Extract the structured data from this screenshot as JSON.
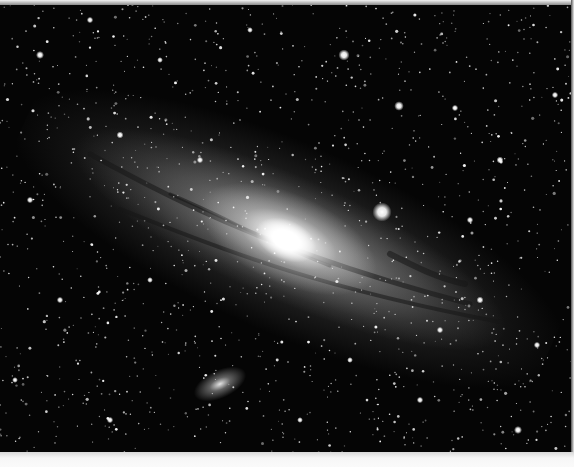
{
  "image": {
    "subject": "Andromeda Galaxy with companion galaxy",
    "colors": {
      "sky": "#050505",
      "core": "#ffffff",
      "border": "#fafafa"
    },
    "main_galaxy": {
      "cx": 288,
      "cy": 235,
      "angle_deg": 24
    },
    "companion_galaxy": {
      "cx": 220,
      "cy": 380,
      "angle_deg": -25
    },
    "satellite_core": {
      "cx": 382,
      "cy": 212,
      "r": 7
    }
  },
  "bright_stars": [
    [
      382,
      212,
      6
    ],
    [
      344,
      55,
      3.5
    ],
    [
      399,
      106,
      3
    ],
    [
      40,
      55,
      2.5
    ],
    [
      90,
      20,
      2
    ],
    [
      120,
      135,
      2.2
    ],
    [
      470,
      220,
      2
    ],
    [
      518,
      430,
      2.5
    ],
    [
      537,
      345,
      2
    ],
    [
      455,
      108,
      2
    ],
    [
      555,
      95,
      2
    ],
    [
      60,
      300,
      2
    ],
    [
      30,
      200,
      2
    ],
    [
      500,
      160,
      2.2
    ],
    [
      160,
      60,
      1.8
    ],
    [
      250,
      30,
      1.8
    ],
    [
      420,
      400,
      2
    ],
    [
      300,
      420,
      1.8
    ],
    [
      110,
      420,
      2
    ],
    [
      15,
      380,
      1.8
    ],
    [
      480,
      300,
      2.2
    ],
    [
      440,
      330,
      2
    ],
    [
      350,
      360,
      1.8
    ],
    [
      200,
      160,
      2
    ],
    [
      150,
      280,
      1.8
    ]
  ]
}
